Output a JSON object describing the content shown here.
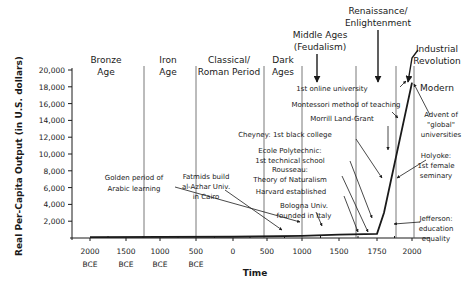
{
  "chart_data": {
    "type": "line",
    "title": "",
    "xlabel": "Time",
    "ylabel": "Real Per-Capita Output (in U.S. dollars)",
    "ylim": [
      0,
      20000
    ],
    "grid": false,
    "x_scale": "non-linear (compressed BCE, expanded after 1500)",
    "x_ticks": [
      {
        "value": -2000,
        "label": [
          "2000",
          "BCE"
        ]
      },
      {
        "value": -1500,
        "label": [
          "1500",
          "BCE"
        ]
      },
      {
        "value": -1000,
        "label": [
          "1000",
          "BCE"
        ]
      },
      {
        "value": -500,
        "label": [
          "500",
          "BCE"
        ]
      },
      {
        "value": 0,
        "label": [
          "0"
        ]
      },
      {
        "value": 500,
        "label": [
          "500"
        ]
      },
      {
        "value": 1000,
        "label": [
          "1000"
        ]
      },
      {
        "value": 1500,
        "label": [
          "1500"
        ]
      },
      {
        "value": 1750,
        "label": [
          "1750"
        ]
      },
      {
        "value": 2000,
        "label": [
          "2000"
        ]
      }
    ],
    "y_ticks": [
      "20,000",
      "18,000",
      "16,000",
      "14,000",
      "12,000",
      "10,000",
      "8,000",
      "6,000",
      "4,000",
      "2,000"
    ],
    "y_tick_values": [
      20000,
      18000,
      16000,
      14000,
      12000,
      10000,
      8000,
      6000,
      4000,
      2000
    ],
    "series": [
      {
        "name": "Real per-capita output",
        "x": [
          -2000,
          0,
          1000,
          1500,
          1750,
          1800,
          2000
        ],
        "y": [
          100,
          150,
          250,
          400,
          500,
          3000,
          18500
        ]
      }
    ],
    "eras": [
      {
        "label": [
          "Bronze",
          "Age"
        ]
      },
      {
        "label": [
          "Iron",
          "Age"
        ]
      },
      {
        "label": [
          "Classical/",
          "Roman Period"
        ]
      },
      {
        "label": [
          "Dark",
          "Ages"
        ]
      },
      {
        "label": [
          "Middle Ages",
          "(Feudalism)"
        ]
      },
      {
        "label": [
          "Renaissance/",
          "Enlightenment"
        ]
      },
      {
        "label": [
          "Industrial",
          "Revolution"
        ]
      },
      {
        "label": [
          "Modern"
        ]
      }
    ],
    "annotations": [
      {
        "label": [
          "Golden period of",
          "Arabic learning"
        ]
      },
      {
        "label": [
          "Fatmids build",
          "al-Azhar Univ.",
          "in Cairo"
        ]
      },
      {
        "label": [
          "Bologna Univ.",
          "founded in Italy"
        ]
      },
      {
        "label": [
          "Harvard established"
        ]
      },
      {
        "label": [
          "Rousseau:",
          "Theory of Naturalism"
        ]
      },
      {
        "label": [
          "Ecole Polytechnic:",
          "1st technical school"
        ]
      },
      {
        "label": [
          "Cheyney: 1st black college"
        ]
      },
      {
        "label": [
          "Morrill Land-Grant"
        ]
      },
      {
        "label": [
          "Montessori method of teaching"
        ]
      },
      {
        "label": [
          "1st online university"
        ]
      },
      {
        "label": [
          "Advent of",
          "\"global\"",
          "universities"
        ]
      },
      {
        "label": [
          "Holyoke:",
          "1st female",
          "seminary"
        ]
      },
      {
        "label": [
          "Jefferson:",
          "education",
          "equality"
        ]
      }
    ]
  }
}
